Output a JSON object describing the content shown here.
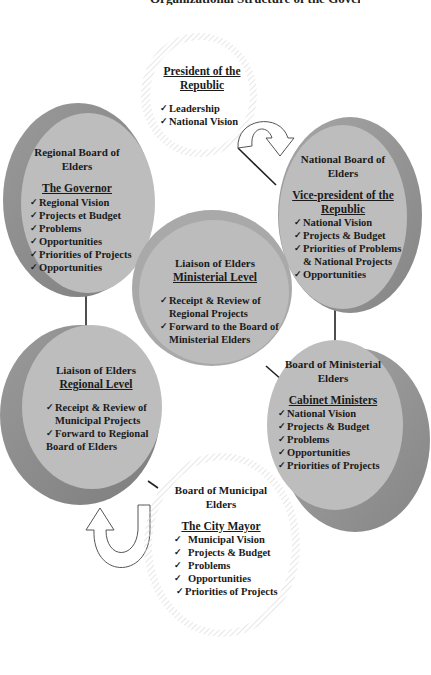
{
  "title": "Organizational Structure of the Government",
  "nodes": {
    "president": {
      "head": "President of the Republic",
      "items": [
        "Leadership",
        "National Vision"
      ]
    },
    "regional_board": {
      "head_line1": "Regional Board of",
      "head_line2": "Elders",
      "sub": "The Governor",
      "items": [
        "Regional Vision",
        "Projects et Budget",
        "Problems",
        "Opportunities",
        "Priorities of Projects",
        "Opportunities"
      ]
    },
    "national_board": {
      "head_line1": "National Board of",
      "head_line2": "Elders",
      "sub_line1": "Vice-president of the",
      "sub_line2": "Republic",
      "items": [
        "National Vision",
        "Projects & Budget",
        "Priorities of Problems"
      ],
      "item_cont": "& National Projects",
      "items_after": [
        "Opportunities"
      ]
    },
    "liaison_ministerial": {
      "head": "Liaison of Elders",
      "sub": "Ministerial Level",
      "item1": "Receipt & Review  of",
      "item1_cont": "Regional Projects",
      "item2": "Forward to the Board of",
      "item2_cont": "Ministerial Elders"
    },
    "liaison_regional": {
      "head": "Liaison of Elders",
      "sub": "Regional Level",
      "item1": "Receipt & Review of",
      "item1_cont": "Municipal Projects",
      "item2": "Forward to Regional",
      "item2_cont": "Board of Elders"
    },
    "ministerial_board": {
      "head_line1": "Board of Ministerial",
      "head_line2": "Elders",
      "sub": "Cabinet Ministers",
      "items": [
        "National Vision",
        "Projects & Budget",
        "Problems",
        "Opportunities",
        "Priorities of Projects"
      ]
    },
    "municipal_board": {
      "head_line1": "Board of Municipal",
      "head_line2": "Elders",
      "sub": "The City Mayor",
      "items": [
        "Municipal Vision",
        "Projects & Budget",
        "Problems",
        "Opportunities",
        "Priorities of Projects"
      ]
    }
  },
  "check_glyph": "✓",
  "colors": {
    "disc_face": "#b9b9b9",
    "disc_edge_light": "#a8a8a8",
    "disc_edge_dark": "#8a8a8a",
    "outline_ring": "#d8d8d8",
    "connector": "#222222"
  }
}
